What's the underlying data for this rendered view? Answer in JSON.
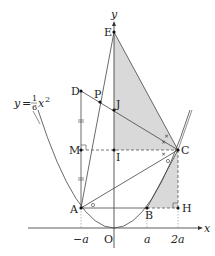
{
  "figure": {
    "curve_label": "y = ⅕x²",
    "curve_label_parts": {
      "y": "y",
      "eq": "=",
      "num": "1",
      "den": "6",
      "x": "x",
      "exp": "2"
    },
    "axes": {
      "x_label": "x",
      "y_label": "y",
      "origin_label": "O"
    },
    "ticks": {
      "neg_a": "−a",
      "a": "a",
      "two_a": "2a"
    },
    "points": {
      "E": "E",
      "D": "D",
      "P": "P",
      "J": "J",
      "M": "M",
      "I": "I",
      "C": "C",
      "A": "A",
      "B": "B",
      "H": "H"
    },
    "colors": {
      "line": "#444444",
      "shade": "#d9d9d9",
      "dash": "#555555",
      "axis": "#333333"
    }
  }
}
